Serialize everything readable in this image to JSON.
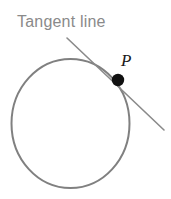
{
  "figure": {
    "title_label": "Tangent line",
    "point_label": "P",
    "background_color": "#ffffff",
    "circle": {
      "stroke_color": "#808080",
      "stroke_width": 2,
      "center_x": 70.5,
      "center_y": 123.5,
      "radius_x": 59,
      "radius_y": 64.5
    },
    "tangent": {
      "stroke_color": "#8a8a8a",
      "stroke_width": 1.6,
      "x1": 67,
      "y1": 38,
      "x2": 164,
      "y2": 130
    },
    "point": {
      "fill_color": "#111111",
      "cx": 118,
      "cy": 80,
      "r": 6.2
    },
    "label_color": "#8a8a8a",
    "point_label_color": "#1a1a1a"
  }
}
